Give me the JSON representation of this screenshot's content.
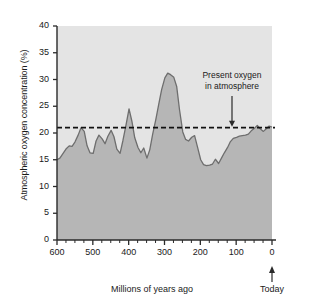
{
  "chart_data": {
    "type": "area",
    "title": "",
    "xlabel": "Millions of years ago",
    "ylabel": "Atmospheric oxygen concentration (%)",
    "xlim": [
      600,
      0
    ],
    "ylim": [
      0,
      40
    ],
    "x_reversed": true,
    "grid": false,
    "legend": "none",
    "xticks": [
      600,
      500,
      400,
      300,
      200,
      100,
      0
    ],
    "xtick_labels": [
      "600",
      "500",
      "400",
      "300",
      "200",
      "100",
      "0"
    ],
    "x_minor_tick_interval": 25,
    "yticks": [
      0,
      5,
      10,
      15,
      20,
      25,
      30,
      35,
      40
    ],
    "ytick_labels": [
      "0",
      "5",
      "10",
      "15",
      "20",
      "25",
      "30",
      "35",
      "40"
    ],
    "series": [
      {
        "name": "Atmospheric oxygen concentration",
        "x": [
          600,
          592,
          583,
          575,
          566,
          558,
          550,
          541,
          533,
          524,
          516,
          508,
          499,
          491,
          483,
          474,
          466,
          458,
          449,
          441,
          433,
          424,
          416,
          408,
          399,
          391,
          383,
          374,
          366,
          358,
          349,
          341,
          333,
          324,
          316,
          308,
          299,
          291,
          283,
          274,
          266,
          258,
          249,
          241,
          233,
          224,
          216,
          208,
          199,
          191,
          183,
          174,
          166,
          158,
          149,
          141,
          133,
          124,
          116,
          108,
          99,
          91,
          83,
          74,
          66,
          58,
          49,
          41,
          33,
          24,
          16,
          8,
          0
        ],
        "y": [
          15.0,
          15.3,
          16.2,
          17.0,
          17.6,
          17.5,
          18.3,
          19.6,
          21.0,
          20.3,
          17.6,
          16.3,
          16.2,
          18.5,
          19.6,
          18.9,
          18.0,
          19.4,
          20.5,
          19.3,
          17.0,
          16.2,
          18.6,
          21.3,
          24.5,
          22.2,
          19.1,
          17.3,
          16.3,
          17.2,
          15.3,
          16.9,
          19.8,
          22.6,
          25.4,
          28.1,
          30.3,
          31.2,
          30.9,
          30.4,
          28.7,
          24.3,
          20.2,
          18.8,
          18.5,
          19.2,
          19.5,
          17.4,
          15.0,
          14.1,
          13.9,
          14.0,
          14.2,
          15.1,
          14.3,
          15.3,
          16.3,
          17.3,
          18.4,
          19.0,
          19.2,
          19.4,
          19.5,
          19.6,
          19.8,
          20.4,
          20.9,
          21.4,
          20.8,
          20.3,
          20.8,
          21.3,
          21.1
        ]
      }
    ],
    "reference_line": {
      "value": 21,
      "style": "dashed",
      "label_line_1": "Present oxygen",
      "label_line_2": "in atmosphere"
    },
    "today_marker": {
      "x": 0,
      "label": "Today"
    }
  },
  "colors": {
    "plot_background": "#e4e4e4",
    "area_fill": "#b6b6b6",
    "curve_line": "#6e6e6e",
    "axis": "#2a2a2a",
    "text": "#1a1a1a",
    "reference_line": "#111111"
  }
}
